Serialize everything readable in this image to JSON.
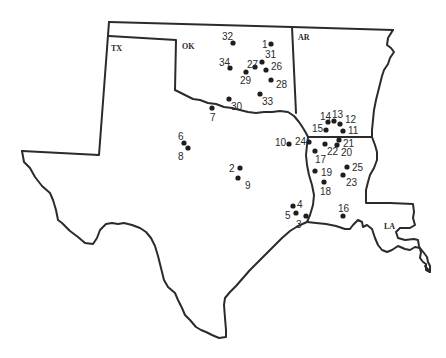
{
  "map": {
    "title": "",
    "states": [
      {
        "id": "TX",
        "label": "TX"
      },
      {
        "id": "OK",
        "label": "OK"
      },
      {
        "id": "AR",
        "label": "AR"
      },
      {
        "id": "LA",
        "label": "LA"
      }
    ],
    "sites": [
      {
        "id": "1",
        "label": "1",
        "state": "OK"
      },
      {
        "id": "2",
        "label": "2",
        "state": "TX"
      },
      {
        "id": "3",
        "label": "3",
        "state": "TX"
      },
      {
        "id": "4",
        "label": "4",
        "state": "TX"
      },
      {
        "id": "5",
        "label": "5",
        "state": "TX"
      },
      {
        "id": "6",
        "label": "6",
        "state": "TX"
      },
      {
        "id": "7",
        "label": "7",
        "state": "TX"
      },
      {
        "id": "8",
        "label": "8",
        "state": "TX"
      },
      {
        "id": "9",
        "label": "9",
        "state": "TX"
      },
      {
        "id": "10",
        "label": "10",
        "state": "TX"
      },
      {
        "id": "11",
        "label": "11",
        "state": "AR"
      },
      {
        "id": "12",
        "label": "12",
        "state": "AR"
      },
      {
        "id": "13",
        "label": "13",
        "state": "AR"
      },
      {
        "id": "14",
        "label": "14",
        "state": "AR"
      },
      {
        "id": "15",
        "label": "15",
        "state": "AR"
      },
      {
        "id": "16",
        "label": "16",
        "state": "LA"
      },
      {
        "id": "17",
        "label": "17",
        "state": "LA"
      },
      {
        "id": "18",
        "label": "18",
        "state": "LA"
      },
      {
        "id": "19",
        "label": "19",
        "state": "LA"
      },
      {
        "id": "20",
        "label": "20",
        "state": "LA"
      },
      {
        "id": "21",
        "label": "21",
        "state": "LA"
      },
      {
        "id": "22",
        "label": "22",
        "state": "LA"
      },
      {
        "id": "23",
        "label": "23",
        "state": "LA"
      },
      {
        "id": "24",
        "label": "24",
        "state": "LA"
      },
      {
        "id": "25",
        "label": "25",
        "state": "LA"
      },
      {
        "id": "26",
        "label": "26",
        "state": "OK"
      },
      {
        "id": "27",
        "label": "27",
        "state": "OK"
      },
      {
        "id": "28",
        "label": "28",
        "state": "OK"
      },
      {
        "id": "29",
        "label": "29",
        "state": "OK"
      },
      {
        "id": "30",
        "label": "30",
        "state": "OK"
      },
      {
        "id": "31",
        "label": "31",
        "state": "OK"
      },
      {
        "id": "32",
        "label": "32",
        "state": "OK"
      },
      {
        "id": "33",
        "label": "33",
        "state": "OK"
      },
      {
        "id": "34",
        "label": "34",
        "state": "OK"
      }
    ]
  }
}
